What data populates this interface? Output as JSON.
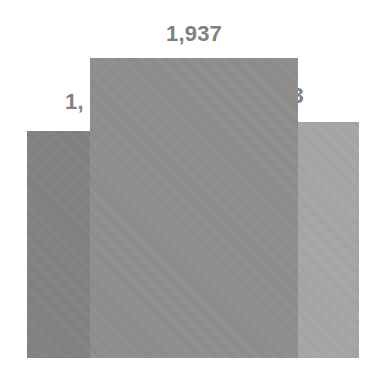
{
  "chart_data": {
    "type": "bar",
    "title": "",
    "subtitle": "",
    "xlabel": "",
    "ylabel": "",
    "categories": [
      "",
      "",
      ""
    ],
    "values": [
      1460,
      1937,
      1533
    ],
    "data_labels": [
      "1,460",
      "1,937",
      "1,533"
    ],
    "visible_label_text": [
      "1,",
      "1,937",
      "33"
    ],
    "label_clipping": "The middle bar is drawn over the left and right data labels, so only '1,' of the left label and '33' of the right label remain visible.",
    "series": [
      {
        "name": "",
        "values": [
          1460,
          1937,
          1533
        ]
      }
    ],
    "colors": [
      "#828282",
      "#8e8e8e",
      "#a6a6a6"
    ],
    "label_color": "#808080",
    "background": "#ffffff",
    "grid": false,
    "legend": false,
    "axes_visible": false,
    "ylim": [
      0,
      2460
    ]
  },
  "chart": {
    "bars": [
      {
        "id": "bar-1",
        "label_visible": "1,",
        "color": "#828282"
      },
      {
        "id": "bar-2",
        "label_visible": "1,937",
        "color": "#8e8e8e"
      },
      {
        "id": "bar-3",
        "label_visible": "33",
        "color": "#a6a6a6"
      }
    ]
  }
}
